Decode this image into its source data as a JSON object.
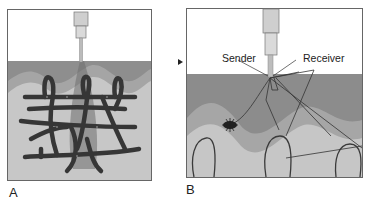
{
  "figure": {
    "panels": [
      {
        "id": "A",
        "label": "A",
        "description": "Needle probe inserted into tissue with network of capillary vessels"
      },
      {
        "id": "B",
        "label": "B",
        "description": "Probe with sender and receiver fibers in tissue surface"
      }
    ],
    "callouts": {
      "sender": "Sender",
      "receiver": "Receiver"
    },
    "colors": {
      "background": "#ffffff",
      "air": "#ffffff",
      "dark_layer": "#8c8c8c",
      "mid_layer": "#a6a6a6",
      "light_tissue": "#c8c8c8",
      "vessel": "#3a3a3a",
      "probe": "#c9c9c9",
      "frame": "#555555"
    }
  }
}
